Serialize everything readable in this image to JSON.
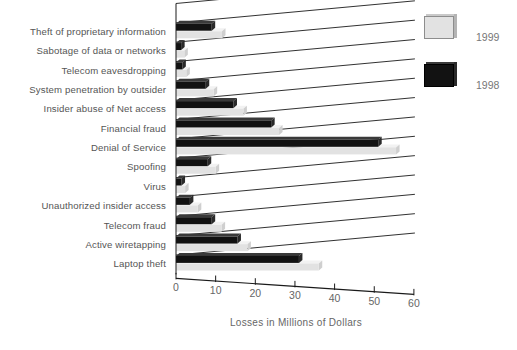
{
  "chart_data": {
    "type": "bar",
    "orientation": "horizontal",
    "title": "",
    "xlabel": "Losses in Millions of Dollars",
    "ylabel": "",
    "xlim": [
      0,
      60
    ],
    "xticks": [
      0,
      10,
      20,
      30,
      40,
      50,
      60
    ],
    "xtick_labels": [
      "0",
      "10",
      "20",
      "30",
      "40",
      "50",
      "60"
    ],
    "grid": false,
    "legend_position": "right-top",
    "categories": [
      "Theft of proprietary information",
      "Sabotage of data or networks",
      "Telecom eavesdropping",
      "System penetration by outsider",
      "Insider abuse of Net access",
      "Financial fraud",
      "Denial of Service",
      "Spoofing",
      "Virus",
      "Unauthorized insider access",
      "Telecom fraud",
      "Active wiretapping",
      "Laptop theft"
    ],
    "series": [
      {
        "name": "1999",
        "color": "#e2e2e2",
        "values": [
          11.6,
          2.1,
          2.6,
          9.5,
          17.0,
          26.0,
          55.5,
          10.0,
          2.3,
          5.5,
          11.5,
          18.0,
          36.0
        ]
      },
      {
        "name": "1998",
        "color": "#121212",
        "values": [
          9.0,
          1.3,
          1.6,
          7.5,
          14.5,
          24.0,
          51.0,
          8.0,
          1.4,
          3.5,
          9.0,
          15.5,
          31.0
        ]
      }
    ]
  },
  "axis": {
    "title": "Losses in Millions of Dollars",
    "tick_labels": [
      "0",
      "10",
      "20",
      "30",
      "40",
      "50",
      "60"
    ]
  },
  "legend": {
    "items": [
      {
        "label": "1999",
        "swatch_color": "#e2e2e2",
        "icon": "legend-swatch-1999"
      },
      {
        "label": "1998",
        "swatch_color": "#121212",
        "icon": "legend-swatch-1998"
      }
    ]
  }
}
